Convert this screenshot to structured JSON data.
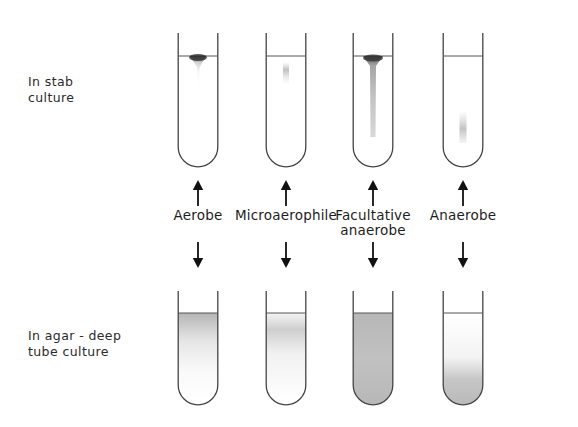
{
  "figure": {
    "background_color": "#ffffff",
    "ink_color": "#3a3a3a",
    "text_color": "#2b2b2b"
  },
  "row_labels": {
    "stab": "In stab\nculture",
    "agar": "In agar - deep\ntube culture"
  },
  "columns": [
    {
      "id": "aerobe",
      "label": "Aerobe",
      "stab_growth": "dense band at medium surface, thin faint stab line below",
      "agar_growth": "growth confined to top of agar column"
    },
    {
      "id": "microaerophile",
      "label": "Microaerophile",
      "stab_growth": "faint growth just below the surface",
      "agar_growth": "faint growth band slightly below the agar surface"
    },
    {
      "id": "facultative-anaerobe",
      "label": "Facultative\nanaerobe",
      "stab_growth": "growth along the entire stab line, heaviest at surface",
      "agar_growth": "growth throughout the whole agar column"
    },
    {
      "id": "anaerobe",
      "label": "Anaerobe",
      "stab_growth": "growth only at the deep bottom of the stab",
      "agar_growth": "growth only at the bottom of the agar column"
    }
  ],
  "arrows": {
    "up_name": "arrow-up",
    "down_name": "arrow-down"
  }
}
